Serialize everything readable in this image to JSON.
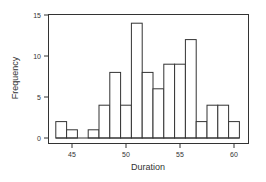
{
  "chart_data": {
    "type": "bar",
    "title": "",
    "xlabel": "Duration",
    "ylabel": "Frequency",
    "categories": [
      44,
      45,
      46,
      47,
      48,
      49,
      50,
      51,
      52,
      53,
      54,
      55,
      56,
      57,
      58,
      59,
      60
    ],
    "values": [
      2,
      1,
      0,
      1,
      4,
      8,
      4,
      14,
      8,
      6,
      9,
      9,
      12,
      2,
      4,
      4,
      2
    ],
    "bin_width": 1,
    "xlim": [
      41.5,
      61.5
    ],
    "ylim": [
      -0.6,
      15.1
    ],
    "x_ticks": [
      45,
      50,
      55,
      60
    ],
    "y_ticks": [
      0,
      5,
      10,
      15
    ],
    "grid": false,
    "legend": null,
    "bar_fill": "#ffffff",
    "bar_edge": "#333333"
  },
  "axes": {
    "x_title": "Duration",
    "y_title": "Frequency",
    "x_tick_labels": [
      "45",
      "50",
      "55",
      "60"
    ],
    "y_tick_labels": [
      "0",
      "5",
      "10",
      "15"
    ]
  }
}
